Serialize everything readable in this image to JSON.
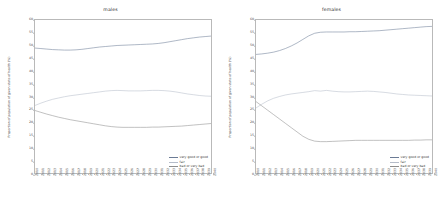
{
  "figure": {
    "background_color": "#ffffff",
    "axis_color": "#b9b9b9"
  },
  "series_colors": {
    "very_good_or_good": "#6b7b95",
    "fair": "#b5bcc9",
    "bad_or_very_bad": "#8d8d8d"
  },
  "legend": {
    "entries": [
      {
        "label": "very good or good",
        "color": "#6b7b95"
      },
      {
        "label": "fair",
        "color": "#b5bcc9"
      },
      {
        "label": "bad or very bad",
        "color": "#8d8d8d"
      }
    ]
  },
  "chart_data": [
    {
      "type": "line",
      "title": "males",
      "xlabel": "",
      "ylabel": "Proportion of population of given state of health (%)",
      "ylim": [
        0,
        60
      ],
      "yticks": [
        0,
        5,
        10,
        15,
        20,
        25,
        30,
        35,
        40,
        45,
        50,
        55,
        60
      ],
      "grid": false,
      "legend_position": "lower right",
      "x": [
        2010,
        2011,
        2012,
        2013,
        2014,
        2015,
        2016,
        2017,
        2018,
        2019,
        2020,
        2021,
        2022,
        2023,
        2024,
        2025,
        2026,
        2027,
        2028,
        2029,
        2030,
        2031,
        2032,
        2033,
        2034,
        2035,
        2036,
        2037,
        2038,
        2039,
        2040
      ],
      "series": [
        {
          "name": "very good or good",
          "values": [
            49.0,
            48.8,
            48.6,
            48.4,
            48.3,
            48.2,
            48.2,
            48.3,
            48.5,
            48.8,
            49.1,
            49.4,
            49.6,
            49.8,
            50.0,
            50.1,
            50.2,
            50.3,
            50.4,
            50.5,
            50.6,
            50.8,
            51.1,
            51.5,
            51.9,
            52.3,
            52.7,
            53.0,
            53.3,
            53.5,
            53.7
          ]
        },
        {
          "name": "fair",
          "values": [
            26.5,
            27.4,
            28.2,
            28.9,
            29.4,
            29.9,
            30.3,
            30.6,
            30.9,
            31.2,
            31.5,
            31.8,
            32.1,
            32.3,
            32.4,
            32.3,
            32.2,
            32.2,
            32.2,
            32.3,
            32.4,
            32.4,
            32.3,
            32.1,
            31.8,
            31.4,
            31.0,
            30.7,
            30.4,
            30.2,
            30.1
          ]
        },
        {
          "name": "bad or very bad",
          "values": [
            24.5,
            23.8,
            23.1,
            22.5,
            21.9,
            21.4,
            20.9,
            20.5,
            20.1,
            19.7,
            19.3,
            18.9,
            18.5,
            18.2,
            18.0,
            17.9,
            17.9,
            17.9,
            17.9,
            17.9,
            18.0,
            18.0,
            18.1,
            18.2,
            18.3,
            18.4,
            18.6,
            18.8,
            19.0,
            19.2,
            19.4
          ]
        }
      ]
    },
    {
      "type": "line",
      "title": "females",
      "xlabel": "",
      "ylabel": "Proportion of population of given state of health (%)",
      "ylim": [
        0,
        60
      ],
      "yticks": [
        0,
        5,
        10,
        15,
        20,
        25,
        30,
        35,
        40,
        45,
        50,
        55,
        60
      ],
      "grid": false,
      "legend_position": "lower right",
      "x": [
        2010,
        2011,
        2012,
        2013,
        2014,
        2015,
        2016,
        2017,
        2018,
        2019,
        2020,
        2021,
        2022,
        2023,
        2024,
        2025,
        2026,
        2027,
        2028,
        2029,
        2030,
        2031,
        2032,
        2033,
        2034,
        2035,
        2036,
        2037,
        2038,
        2039,
        2040
      ],
      "series": [
        {
          "name": "very good or good",
          "values": [
            46.5,
            46.7,
            47.0,
            47.4,
            48.0,
            48.8,
            49.8,
            51.0,
            52.4,
            53.8,
            54.8,
            55.2,
            55.3,
            55.3,
            55.3,
            55.3,
            55.4,
            55.4,
            55.5,
            55.6,
            55.7,
            55.8,
            56.0,
            56.2,
            56.4,
            56.6,
            56.8,
            57.0,
            57.2,
            57.4,
            57.5
          ]
        },
        {
          "name": "fair",
          "values": [
            25.5,
            27.0,
            28.3,
            29.3,
            30.0,
            30.6,
            31.0,
            31.3,
            31.6,
            31.9,
            32.3,
            32.1,
            32.4,
            32.1,
            31.9,
            31.8,
            31.8,
            31.9,
            32.0,
            32.1,
            32.0,
            31.8,
            31.6,
            31.3,
            31.0,
            30.8,
            30.6,
            30.5,
            30.4,
            30.3,
            30.2
          ]
        },
        {
          "name": "bad or very bad",
          "values": [
            28.0,
            26.3,
            24.6,
            22.9,
            21.2,
            19.5,
            17.8,
            16.1,
            14.4,
            13.2,
            12.5,
            12.3,
            12.3,
            12.4,
            12.5,
            12.6,
            12.7,
            12.8,
            12.8,
            12.8,
            12.8,
            12.8,
            12.8,
            12.8,
            12.8,
            12.8,
            12.8,
            12.9,
            12.9,
            13.0,
            13.0
          ]
        }
      ]
    }
  ]
}
